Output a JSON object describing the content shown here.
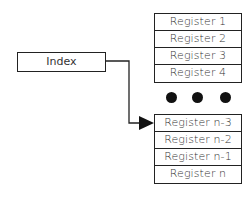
{
  "diagram": {
    "index_label": "Index",
    "top_registers": [
      "Register 1",
      "Register 2",
      "Register 3",
      "Register 4"
    ],
    "ellipsis": "● ● ●",
    "bottom_registers": [
      "Register n-3",
      "Register n-2",
      "Register n-1",
      "Register n"
    ],
    "arrow_target": "Register n-3",
    "colors": {
      "line": "#222222",
      "fill": "#ffffff",
      "dot": "#111111",
      "text": "#333333"
    }
  }
}
